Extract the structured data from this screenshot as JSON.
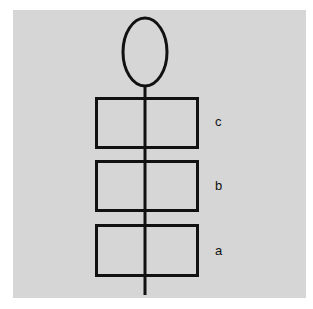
{
  "diagram": {
    "background_color": "#d6d6d6",
    "stroke_color": "#111111",
    "head": {
      "shape": "ellipse"
    },
    "segments": [
      {
        "label": "c"
      },
      {
        "label": "b"
      },
      {
        "label": "a"
      }
    ]
  }
}
